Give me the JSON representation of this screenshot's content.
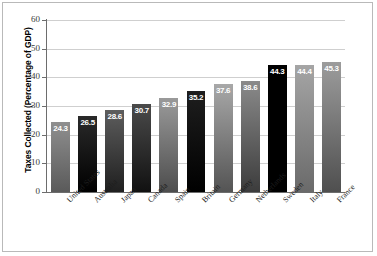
{
  "chart_data": {
    "type": "bar",
    "title": "",
    "subtitle": "",
    "xlabel": "",
    "ylabel": "Taxes Collected (Percentage of GDP)",
    "ylim": [
      0,
      60
    ],
    "yticks": [
      "0",
      "10",
      "20",
      "30",
      "40",
      "50",
      "60"
    ],
    "grid": true,
    "legend": "none",
    "categories": [
      "United States",
      "Australia",
      "Japan",
      "Canada",
      "Spain",
      "Britain",
      "Germany",
      "Netherlands",
      "Sweden",
      "Italy",
      "France"
    ],
    "values": [
      24.3,
      26.5,
      28.6,
      30.7,
      32.9,
      35.2,
      37.6,
      38.6,
      44.3,
      44.4,
      45.3
    ],
    "value_labels": [
      "24.3",
      "26.5",
      "28.6",
      "30.7",
      "32.9",
      "35.2",
      "37.6",
      "38.6",
      "44.3",
      "44.4",
      "45.3"
    ],
    "bar_colors_top": [
      "#8f8f8f",
      "#2a2a2a",
      "#5d5d5d",
      "#4a4a4a",
      "#9a9a9a",
      "#1e1e1e",
      "#a8a8a8",
      "#8a8a8a",
      "#000000",
      "#a5a5a5",
      "#9c9c9c"
    ],
    "bar_colors_bottom": [
      "#5a5a5a",
      "#000000",
      "#1f1f1f",
      "#111111",
      "#4d4d4d",
      "#000000",
      "#545454",
      "#3c3c3c",
      "#000000",
      "#6a6a6a",
      "#4f4f4f"
    ],
    "colors": {
      "grid": "#cfcfcf",
      "axis": "#6d6d6d",
      "frame": "#b9b9b9",
      "background": "#ffffff",
      "label_text": "#ffffff"
    }
  }
}
